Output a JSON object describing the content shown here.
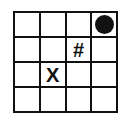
{
  "grid": {
    "rows": 4,
    "columns": 4,
    "border_color": "#111111",
    "background_color": "#ffffff",
    "cells": [
      [
        {
          "type": "empty",
          "label": ""
        },
        {
          "type": "empty",
          "label": ""
        },
        {
          "type": "empty",
          "label": ""
        },
        {
          "type": "dot",
          "label": ""
        }
      ],
      [
        {
          "type": "empty",
          "label": ""
        },
        {
          "type": "empty",
          "label": ""
        },
        {
          "type": "text",
          "label": "#"
        },
        {
          "type": "empty",
          "label": ""
        }
      ],
      [
        {
          "type": "empty",
          "label": ""
        },
        {
          "type": "text",
          "label": "X"
        },
        {
          "type": "empty",
          "label": ""
        },
        {
          "type": "empty",
          "label": ""
        }
      ],
      [
        {
          "type": "empty",
          "label": ""
        },
        {
          "type": "empty",
          "label": ""
        },
        {
          "type": "empty",
          "label": ""
        },
        {
          "type": "empty",
          "label": ""
        }
      ]
    ]
  }
}
